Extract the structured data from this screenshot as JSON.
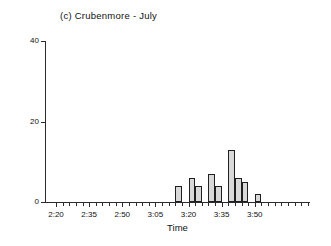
{
  "chart_data": {
    "type": "bar",
    "title": "(c) Crubenmore - July",
    "xlabel": "Time",
    "ylabel": "No. of song flights",
    "ylim": [
      0,
      40
    ],
    "yticks": [
      0,
      20,
      40
    ],
    "ytick_labels": [
      "0",
      "20",
      "40"
    ],
    "grid": false,
    "legend": null,
    "xlim_minutes": [
      135,
      255
    ],
    "x_tick_interval_minutes": 3,
    "xtick_labels": [
      "2:20",
      "2:35",
      "2:50",
      "3:05",
      "3:20",
      "3:35",
      "3:50"
    ],
    "xtick_label_minutes": [
      140,
      155,
      170,
      185,
      200,
      215,
      230
    ],
    "bin_width_minutes": 3,
    "categories": [
      "3:14",
      "3:17",
      "3:20",
      "3:23",
      "3:26",
      "3:29",
      "3:32",
      "3:35",
      "3:38",
      "3:41",
      "3:44",
      "3:47",
      "3:50",
      "3:53"
    ],
    "values": [
      4,
      0,
      6,
      4,
      0,
      7,
      4,
      0,
      13,
      6,
      5,
      0,
      0,
      2
    ],
    "bars": [
      {
        "start_minutes": 194,
        "value": 4
      },
      {
        "start_minutes": 200,
        "value": 6
      },
      {
        "start_minutes": 203,
        "value": 4
      },
      {
        "start_minutes": 209,
        "value": 7
      },
      {
        "start_minutes": 212,
        "value": 4
      },
      {
        "start_minutes": 218,
        "value": 13
      },
      {
        "start_minutes": 221,
        "value": 6
      },
      {
        "start_minutes": 224,
        "value": 5
      },
      {
        "start_minutes": 230,
        "value": 2
      }
    ],
    "colors": {
      "bar_fill": "#d9d9d9",
      "bar_stroke": "#1f1f1f",
      "axis": "#2b2b2b",
      "text": "#111111",
      "background": "#ffffff"
    }
  }
}
